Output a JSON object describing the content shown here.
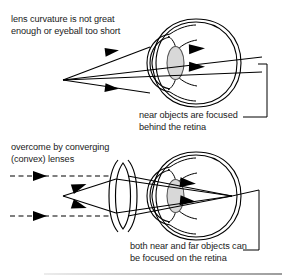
{
  "figure": {
    "title_fragment_cropped": "",
    "top_panel": {
      "caption_left": "lens curvature is not great\nenough or eyeball too short",
      "caption_right": "near objects are focused\nbehind the retina",
      "condition": "hyperopia"
    },
    "bottom_panel": {
      "caption_left": "overcome by converging\n(convex) lenses",
      "caption_right": "both near and far objects can\nbe focused on the retina",
      "condition": "hyperopia-corrected"
    },
    "colors": {
      "ink": "#1a1a1a",
      "outline": "#000000",
      "lens_fill": "#d8d8d8",
      "lens_stroke": "#555555",
      "background": "#ffffff",
      "bottom_edge": "#8c8c8c"
    },
    "labels": {
      "eye_lens": "lens",
      "retina": "retina",
      "cornea": "cornea",
      "corrective_lens": "convex lens",
      "near_rays": "solid converging rays from near object",
      "far_rays": "dashed parallel rays from far object",
      "focus_point_top": "focal point behind retina",
      "focus_point_bottom": "focal point on retina"
    }
  }
}
